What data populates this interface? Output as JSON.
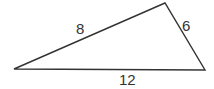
{
  "diagram": {
    "type": "triangle",
    "vertices": {
      "left": [
        14,
        69
      ],
      "top": [
        165,
        3
      ],
      "right": [
        205,
        70
      ]
    },
    "sides": [
      {
        "name": "left-top",
        "label": "8"
      },
      {
        "name": "top-right",
        "label": "6"
      },
      {
        "name": "bottom",
        "label": "12"
      }
    ],
    "stroke_color": "#333333",
    "background": "#ffffff"
  }
}
